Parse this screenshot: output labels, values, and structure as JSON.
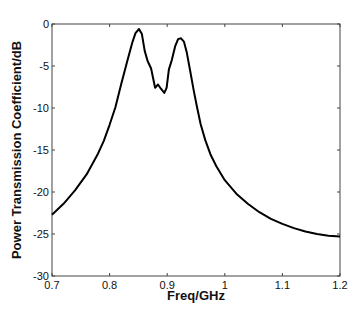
{
  "chart_data": {
    "type": "line",
    "title": "",
    "xlabel": "Freq/GHz",
    "ylabel": "Power Transmission Coefficient/dB",
    "xlim": [
      0.7,
      1.2
    ],
    "ylim": [
      -30,
      0
    ],
    "grid": false,
    "legend": null,
    "xticks": [
      "0.7",
      "0.8",
      "0.9",
      "1",
      "1.1",
      "1.2"
    ],
    "yticks": [
      "0",
      "-5",
      "-10",
      "-15",
      "-20",
      "-25",
      "-30"
    ],
    "series": [
      {
        "name": "Power Transmission Coefficient",
        "color": "#000000",
        "x": [
          0.7,
          0.72,
          0.74,
          0.76,
          0.78,
          0.79,
          0.8,
          0.81,
          0.82,
          0.83,
          0.835,
          0.84,
          0.845,
          0.851,
          0.856,
          0.861,
          0.866,
          0.872,
          0.879,
          0.884,
          0.889,
          0.895,
          0.899,
          0.903,
          0.908,
          0.914,
          0.919,
          0.924,
          0.929,
          0.934,
          0.94,
          0.946,
          0.952,
          0.958,
          0.966,
          0.975,
          0.985,
          1.0,
          1.02,
          1.04,
          1.06,
          1.08,
          1.1,
          1.12,
          1.14,
          1.16,
          1.18,
          1.2
        ],
        "y": [
          -22.7,
          -21.4,
          -19.8,
          -17.9,
          -15.4,
          -13.9,
          -12.0,
          -9.9,
          -7.2,
          -4.6,
          -3.3,
          -2.1,
          -1.1,
          -0.6,
          -1.2,
          -3.2,
          -4.4,
          -5.3,
          -7.6,
          -7.2,
          -7.7,
          -8.2,
          -7.6,
          -5.4,
          -4.3,
          -2.6,
          -1.8,
          -1.7,
          -2.1,
          -3.4,
          -5.6,
          -7.9,
          -10.0,
          -11.9,
          -13.8,
          -15.5,
          -16.9,
          -18.6,
          -20.2,
          -21.4,
          -22.4,
          -23.2,
          -23.8,
          -24.3,
          -24.7,
          -25.0,
          -25.2,
          -25.3
        ]
      }
    ]
  }
}
